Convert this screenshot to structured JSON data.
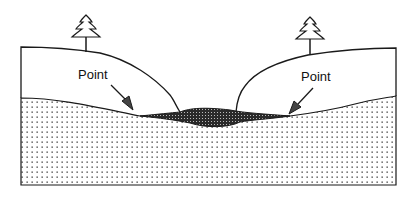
{
  "diagram": {
    "type": "cross-section",
    "labels": {
      "left_point": "Point",
      "right_point": "Point"
    },
    "colors": {
      "line": "#1a1a1a",
      "dot": "#333333",
      "background": "#ffffff",
      "deposit": "#2a2a2a"
    },
    "icons": [
      "tree-icon",
      "tree-icon"
    ]
  }
}
